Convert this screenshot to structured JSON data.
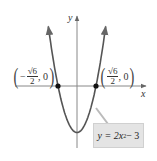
{
  "chart_data": {
    "type": "line",
    "title": "",
    "function": "y = 2x^2 - 3",
    "xlabel": "x",
    "ylabel": "y",
    "grid": false,
    "xlim": [
      -4,
      4.5
    ],
    "ylim": [
      -4,
      4.5
    ],
    "series": [
      {
        "name": "y = 2x^2 - 3",
        "x": [
          -1.85,
          -1.5,
          -1.2247,
          -1.0,
          -0.5,
          0,
          0.5,
          1.0,
          1.2247,
          1.5,
          1.85
        ],
        "y": [
          3.85,
          1.5,
          0,
          -1.0,
          -2.5,
          -3.0,
          -2.5,
          -1.0,
          0,
          1.5,
          3.85
        ]
      }
    ],
    "annotations": [
      {
        "label": "(-√6/2, 0)",
        "x": -1.2247,
        "y": 0
      },
      {
        "label": "(√6/2, 0)",
        "x": 1.2247,
        "y": 0
      },
      {
        "label": "y = 2x² − 3",
        "type": "callout"
      }
    ]
  },
  "labels": {
    "x_axis": "x",
    "y_axis": "y",
    "left_point": {
      "sign": "−",
      "numerator": "√6",
      "denominator": "2",
      "y": "0"
    },
    "right_point": {
      "numerator": "√6",
      "denominator": "2",
      "y": "0"
    },
    "equation": {
      "lhs": "y = 2x",
      "exp": "2",
      "rhs": " − 3"
    }
  },
  "colors": {
    "curve": "#555555",
    "axis": "#777777",
    "point": "#111111",
    "callout_bg": "#e4e4e4"
  }
}
